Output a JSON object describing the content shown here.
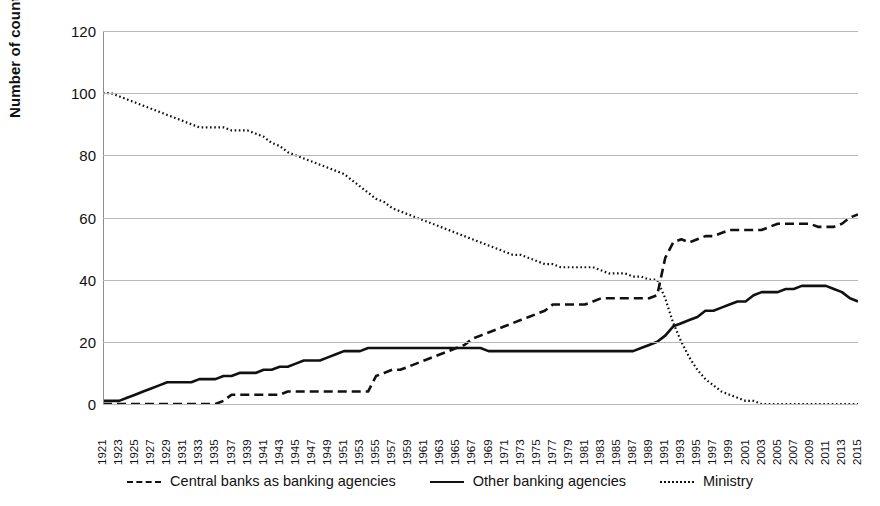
{
  "chart_data": {
    "type": "line",
    "title": "",
    "xlabel": "",
    "ylabel": "Number of countries",
    "ylim": [
      0,
      120
    ],
    "ytick_values": [
      0,
      20,
      40,
      60,
      80,
      100,
      120
    ],
    "grid": true,
    "legend_position": "bottom",
    "x": [
      1921,
      1922,
      1923,
      1924,
      1925,
      1926,
      1927,
      1928,
      1929,
      1930,
      1931,
      1932,
      1933,
      1934,
      1935,
      1936,
      1937,
      1938,
      1939,
      1940,
      1941,
      1942,
      1943,
      1944,
      1945,
      1946,
      1947,
      1948,
      1949,
      1950,
      1951,
      1952,
      1953,
      1954,
      1955,
      1956,
      1957,
      1958,
      1959,
      1960,
      1961,
      1962,
      1963,
      1964,
      1965,
      1966,
      1967,
      1968,
      1969,
      1970,
      1971,
      1972,
      1973,
      1974,
      1975,
      1976,
      1977,
      1978,
      1979,
      1980,
      1981,
      1982,
      1983,
      1984,
      1985,
      1986,
      1987,
      1988,
      1989,
      1990,
      1991,
      1992,
      1993,
      1994,
      1995,
      1996,
      1997,
      1998,
      1999,
      2000,
      2001,
      2002,
      2003,
      2004,
      2005,
      2006,
      2007,
      2008,
      2009,
      2010,
      2011,
      2012,
      2013,
      2014,
      2015
    ],
    "xtick_labels": [
      "1921",
      "1923",
      "1925",
      "1927",
      "1929",
      "1931",
      "1933",
      "1935",
      "1937",
      "1939",
      "1941",
      "1943",
      "1945",
      "1947",
      "1949",
      "1951",
      "1953",
      "1955",
      "1957",
      "1959",
      "1961",
      "1963",
      "1965",
      "1967",
      "1969",
      "1971",
      "1973",
      "1975",
      "1977",
      "1979",
      "1981",
      "1983",
      "1985",
      "1987",
      "1989",
      "1991",
      "1993",
      "1995",
      "1997",
      "1999",
      "2001",
      "2003",
      "2005",
      "2007",
      "2009",
      "2011",
      "2013",
      "2015"
    ],
    "series": [
      {
        "name": "Central banks as banking agencies",
        "style": "dashed",
        "color": "#111111",
        "values": [
          0,
          0,
          0,
          0,
          0,
          0,
          0,
          0,
          0,
          0,
          0,
          0,
          0,
          0,
          0,
          1,
          3,
          3,
          3,
          3,
          3,
          3,
          3,
          4,
          4,
          4,
          4,
          4,
          4,
          4,
          4,
          4,
          4,
          4,
          9,
          10,
          11,
          11,
          12,
          13,
          14,
          15,
          16,
          17,
          18,
          19,
          21,
          22,
          23,
          24,
          25,
          26,
          27,
          28,
          29,
          30,
          32,
          32,
          32,
          32,
          32,
          33,
          34,
          34,
          34,
          34,
          34,
          34,
          34,
          35,
          47,
          52,
          53,
          52,
          53,
          54,
          54,
          55,
          56,
          56,
          56,
          56,
          56,
          57,
          58,
          58,
          58,
          58,
          58,
          57,
          57,
          57,
          58,
          60,
          61
        ]
      },
      {
        "name": "Other banking agencies",
        "style": "solid",
        "color": "#111111",
        "values": [
          1,
          1,
          1,
          2,
          3,
          4,
          5,
          6,
          7,
          7,
          7,
          7,
          8,
          8,
          8,
          9,
          9,
          10,
          10,
          10,
          11,
          11,
          12,
          12,
          13,
          14,
          14,
          14,
          15,
          16,
          17,
          17,
          17,
          18,
          18,
          18,
          18,
          18,
          18,
          18,
          18,
          18,
          18,
          18,
          18,
          18,
          18,
          18,
          17,
          17,
          17,
          17,
          17,
          17,
          17,
          17,
          17,
          17,
          17,
          17,
          17,
          17,
          17,
          17,
          17,
          17,
          17,
          18,
          19,
          20,
          22,
          25,
          26,
          27,
          28,
          30,
          30,
          31,
          32,
          33,
          33,
          35,
          36,
          36,
          36,
          37,
          37,
          38,
          38,
          38,
          38,
          37,
          36,
          34,
          33
        ]
      },
      {
        "name": "Ministry",
        "style": "dotted",
        "color": "#111111",
        "values": [
          100,
          100,
          99,
          98,
          97,
          96,
          95,
          94,
          93,
          92,
          91,
          90,
          89,
          89,
          89,
          89,
          88,
          88,
          88,
          87,
          86,
          84,
          83,
          81,
          80,
          79,
          78,
          77,
          76,
          75,
          74,
          72,
          70,
          68,
          66,
          65,
          63,
          62,
          61,
          60,
          59,
          58,
          57,
          56,
          55,
          54,
          53,
          52,
          51,
          50,
          49,
          48,
          48,
          47,
          46,
          45,
          45,
          44,
          44,
          44,
          44,
          44,
          43,
          42,
          42,
          42,
          41,
          41,
          40,
          40,
          34,
          26,
          20,
          15,
          11,
          8,
          6,
          4,
          3,
          2,
          1,
          1,
          0,
          0,
          0,
          0,
          0,
          0,
          0,
          0,
          0,
          0,
          0,
          0,
          0
        ]
      }
    ],
    "legend": [
      {
        "label": "Central banks as banking agencies",
        "style": "dashed"
      },
      {
        "label": "Other banking agencies",
        "style": "solid"
      },
      {
        "label": "Ministry",
        "style": "dotted"
      }
    ]
  }
}
